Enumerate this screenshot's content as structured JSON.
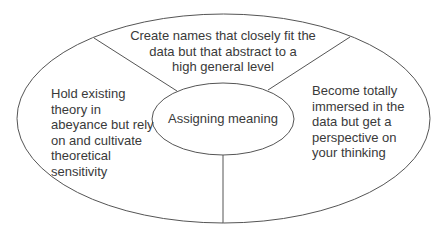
{
  "diagram": {
    "title": "Assigning meaning",
    "center": {
      "label": "Assigning meaning"
    },
    "segments": [
      {
        "position": "top",
        "lines": [
          "Create names that closely fit the",
          "data but that abstract to a",
          "high general level"
        ]
      },
      {
        "position": "left",
        "lines": [
          "Hold existing",
          "theory in",
          "abeyance but rely",
          "on and cultivate",
          "theoretical",
          "sensitivity"
        ]
      },
      {
        "position": "right",
        "lines": [
          "Become totally",
          "immersed in the",
          "data but get a",
          "perspective on",
          "your thinking"
        ]
      }
    ],
    "colors": {
      "stroke": "#555555",
      "text": "#3a3a3a",
      "background": "#ffffff"
    }
  }
}
